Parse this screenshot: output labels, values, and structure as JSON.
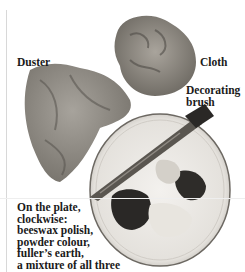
{
  "labels": {
    "duster": "Duster",
    "cloth": "Cloth",
    "brush_line1": "Decorating",
    "brush_line2": "brush",
    "plate_caption": [
      "On the plate,",
      "clockwise:",
      "beeswax polish,",
      "powder colour,",
      "fuller’s earth,",
      "a mixture of all three"
    ]
  }
}
